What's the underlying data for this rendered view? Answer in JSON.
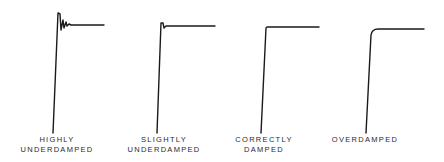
{
  "figure": {
    "panels": [
      {
        "id": "highly-underdamped",
        "label_line1": "HIGHLY",
        "label_line2": "UNDERDAMPED"
      },
      {
        "id": "slightly-underdamped",
        "label_line1": "SLIGHTLY",
        "label_line2": "UNDERDAMPED"
      },
      {
        "id": "correctly-damped",
        "label_line1": "CORRECTLY",
        "label_line2": "DAMPED"
      },
      {
        "id": "overdamped",
        "label_line1": "OVERDAMPED",
        "label_line2": ""
      }
    ],
    "stroke_color": "#1a1a1a",
    "background": "#ffffff"
  }
}
